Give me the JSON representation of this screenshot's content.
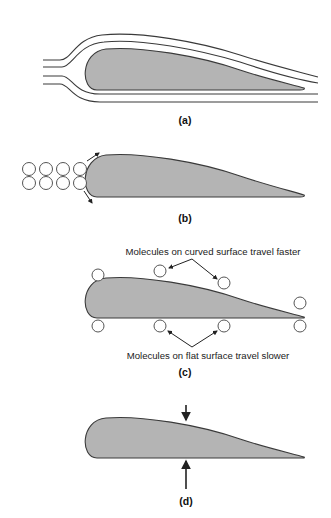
{
  "figure": {
    "panels": [
      {
        "id": "a",
        "label": "(a)",
        "description": "Airflow streamlines around an airfoil"
      },
      {
        "id": "b",
        "label": "(b)",
        "description": "Air molecules meeting the leading edge and splitting above and below"
      },
      {
        "id": "c",
        "label": "(c)",
        "annotations": {
          "curved": "Molecules on curved surface travel faster",
          "flat": "Molecules on flat surface travel slower"
        }
      },
      {
        "id": "d",
        "label": "(d)",
        "description": "Pressure arrows on upper and lower surfaces"
      }
    ],
    "colors": {
      "airfoil_fill": "#b4b4b4",
      "outline": "#3a3a3a",
      "background": "#ffffff"
    }
  }
}
